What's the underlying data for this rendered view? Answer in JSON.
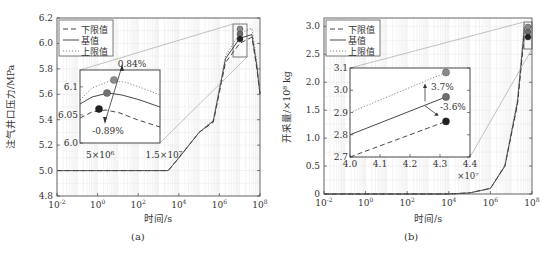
{
  "chart_data": [
    {
      "id": "a",
      "type": "line",
      "caption": "(a)",
      "xlabel": "时间/s",
      "ylabel": "注气井口压力/MPa",
      "xscale": "log",
      "xlim": [
        0.01,
        100000000
      ],
      "ylim": [
        4.8,
        6.2
      ],
      "xticks": [
        "10-2",
        "100",
        "102",
        "104",
        "106",
        "108"
      ],
      "yticks": [
        "4.8",
        "5.0",
        "5.2",
        "5.4",
        "5.6",
        "5.8",
        "6.0",
        "6.2"
      ],
      "grid": true,
      "legend": {
        "position": "upper-left",
        "entries": [
          "下限值",
          "基值",
          "上限值"
        ]
      },
      "series": [
        {
          "name": "下限值",
          "style": "dashed",
          "x": [
            0.01,
            3000,
            10000,
            100000,
            500000,
            2000000,
            10000000,
            40000000,
            70000000,
            100000000
          ],
          "y": [
            5.0,
            5.0,
            5.1,
            5.3,
            5.38,
            5.85,
            6.0,
            6.05,
            5.8,
            5.6
          ]
        },
        {
          "name": "基值",
          "style": "solid",
          "x": [
            0.01,
            3000,
            10000,
            100000,
            500000,
            2000000,
            10000000,
            40000000,
            70000000,
            100000000
          ],
          "y": [
            5.0,
            5.0,
            5.1,
            5.3,
            5.39,
            5.88,
            6.04,
            6.07,
            5.82,
            5.6
          ]
        },
        {
          "name": "上限值",
          "style": "dotted",
          "x": [
            0.01,
            3000,
            10000,
            100000,
            500000,
            2000000,
            10000000,
            40000000,
            70000000,
            100000000
          ],
          "y": [
            5.0,
            5.0,
            5.1,
            5.3,
            5.4,
            5.9,
            6.08,
            6.12,
            5.85,
            5.6
          ]
        }
      ],
      "markers": [
        {
          "series": "上限值",
          "x": 40000000,
          "y": 6.11,
          "color": "#8a8a8a"
        },
        {
          "series": "基值",
          "x": 40000000,
          "y": 6.06,
          "color": "#6a6a6a"
        },
        {
          "series": "下限值",
          "x": 40000000,
          "y": 6.02,
          "color": "#222222"
        }
      ],
      "inset": {
        "xlim_labels": [
          "5×10⁶",
          "1.5×10⁷"
        ],
        "yticks": [
          "6.0",
          "6.05",
          "6.1"
        ],
        "ylim": [
          6.0,
          6.13
        ],
        "annotations": [
          "0.84%",
          "-0.89%"
        ],
        "points": [
          {
            "name": "上限值",
            "x": 7500000,
            "y": 6.117
          },
          {
            "name": "基值",
            "x": 7000000,
            "y": 6.083
          },
          {
            "name": "下限值",
            "x": 6000000,
            "y": 6.054
          }
        ]
      }
    },
    {
      "id": "b",
      "type": "line",
      "caption": "(b)",
      "xlabel": "时间/s",
      "ylabel": "开采量/×10⁸ kg",
      "xscale": "log",
      "xlim": [
        0.01,
        100000000
      ],
      "ylim": [
        0,
        3.15
      ],
      "xticks": [
        "10-2",
        "100",
        "102",
        "104",
        "106",
        "108"
      ],
      "yticks": [
        "0",
        "0.5",
        "1.0",
        "1.5",
        "2.0",
        "2.5",
        "3.0"
      ],
      "grid": true,
      "legend": {
        "position": "upper-left",
        "entries": [
          "下限值",
          "基值",
          "上限值"
        ]
      },
      "series": [
        {
          "name": "下限值",
          "style": "dashed",
          "x": [
            0.01,
            10000,
            100000,
            1000000,
            5000000,
            20000000,
            43000000
          ],
          "y": [
            0,
            0,
            0.02,
            0.1,
            0.5,
            1.6,
            2.86
          ]
        },
        {
          "name": "基值",
          "style": "solid",
          "x": [
            0.01,
            10000,
            100000,
            1000000,
            5000000,
            20000000,
            43000000
          ],
          "y": [
            0,
            0,
            0.02,
            0.1,
            0.5,
            1.65,
            2.97
          ]
        },
        {
          "name": "上限值",
          "style": "dotted",
          "x": [
            0.01,
            10000,
            100000,
            1000000,
            5000000,
            20000000,
            43000000
          ],
          "y": [
            0,
            0,
            0.02,
            0.1,
            0.52,
            1.7,
            3.08
          ]
        }
      ],
      "markers": [
        {
          "series": "上限值",
          "x": 43000000,
          "y": 3.08,
          "color": "#8a8a8a"
        },
        {
          "series": "基值",
          "x": 43000000,
          "y": 2.97,
          "color": "#6a6a6a"
        },
        {
          "series": "下限值",
          "x": 43000000,
          "y": 2.86,
          "color": "#222222"
        }
      ],
      "inset": {
        "xticks": [
          "4.0",
          "4.1",
          "4.2",
          "4.3",
          "4.4"
        ],
        "xmult": "×10⁷",
        "yticks": [
          "2.7",
          "2.8",
          "2.9",
          "3.0",
          "3.1"
        ],
        "xlim": [
          4.0,
          4.4
        ],
        "ylim": [
          2.7,
          3.1
        ],
        "annotations": [
          "3.7%",
          "-3.6%"
        ],
        "lines": [
          {
            "name": "上限值",
            "style": "dotted",
            "x": [
              4.0,
              4.32
            ],
            "y": [
              2.9,
              3.08
            ]
          },
          {
            "name": "基值",
            "style": "solid",
            "x": [
              4.0,
              4.32
            ],
            "y": [
              2.8,
              2.97
            ]
          },
          {
            "name": "下限值",
            "style": "dashed",
            "x": [
              4.0,
              4.32
            ],
            "y": [
              2.7,
              2.86
            ]
          }
        ]
      }
    }
  ],
  "captions": {
    "a": "(a)",
    "b": "(b)"
  }
}
